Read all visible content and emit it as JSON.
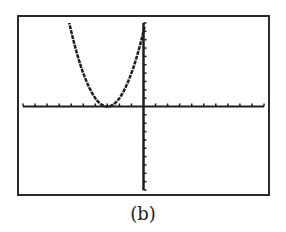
{
  "caption": "(b)",
  "colors": {
    "frame": "#2a2a2a",
    "axes": "#1e1e1e",
    "curve": "#1e1e1e",
    "background": "#ffffff"
  },
  "chart_data": {
    "type": "line",
    "title": "",
    "xlabel": "",
    "ylabel": "",
    "xlim": [
      -10,
      10
    ],
    "ylim": [
      -10,
      10
    ],
    "xscale_tick": 1,
    "yscale_tick": 1,
    "grid": false,
    "legend": null,
    "function": "y = (x + 3)^2",
    "series": [
      {
        "name": "parabola",
        "x": [
          -6.3,
          -6,
          -5.5,
          -5,
          -4.5,
          -4,
          -3.5,
          -3,
          -2.5,
          -2,
          -1.5,
          -1,
          -0.5,
          0,
          0.1
        ],
        "y": [
          10.9,
          9,
          6.25,
          4,
          2.25,
          1,
          0.25,
          0,
          0.25,
          1,
          2.25,
          4,
          6.25,
          9,
          9.6
        ]
      }
    ],
    "annotations": [
      "(b)"
    ]
  }
}
